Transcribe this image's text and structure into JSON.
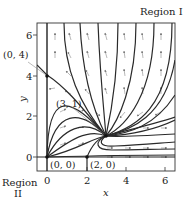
{
  "figure": {
    "type": "phase-portrait",
    "region_labels": {
      "region_1": "Region I",
      "region_2_line1": "Region",
      "region_2_line2": "II"
    },
    "axes": {
      "xlabel": "x",
      "ylabel": "y",
      "x_ticks": [
        "0",
        "2",
        "4",
        "6"
      ],
      "y_ticks": [
        "0",
        "2",
        "4",
        "6"
      ],
      "xlim": [
        -0.5,
        6.5
      ],
      "ylim": [
        -0.7,
        6.6
      ]
    },
    "equilibria": [
      {
        "label": "(0, 0)",
        "x": 0,
        "y": 0
      },
      {
        "label": "(2, 0)",
        "x": 2,
        "y": 0
      },
      {
        "label": "(0, 4)",
        "x": 0,
        "y": 4
      },
      {
        "label": "(3, 1)",
        "x": 3,
        "y": 1
      }
    ],
    "colors": {
      "trajectory": "#2a2a2a",
      "arrow": "#7a7a7a",
      "frame": "#333333"
    }
  }
}
